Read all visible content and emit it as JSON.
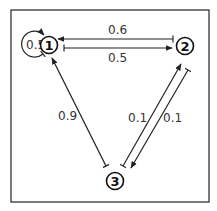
{
  "diagram": {
    "type": "state-transition-graph",
    "nodes": [
      {
        "id": "1",
        "label": "1"
      },
      {
        "id": "2",
        "label": "2"
      },
      {
        "id": "3",
        "label": "3"
      }
    ],
    "edges": [
      {
        "from": "1",
        "to": "1",
        "weight": "0.5"
      },
      {
        "from": "2",
        "to": "1",
        "weight": "0.6"
      },
      {
        "from": "1",
        "to": "2",
        "weight": "0.5"
      },
      {
        "from": "3",
        "to": "1",
        "weight": "0.9"
      },
      {
        "from": "3",
        "to": "2",
        "weight": "0.1"
      },
      {
        "from": "2",
        "to": "3",
        "weight": "0.1"
      }
    ],
    "colors": {
      "stroke": "#222222",
      "label": "#333333",
      "background": "#ffffff"
    }
  }
}
